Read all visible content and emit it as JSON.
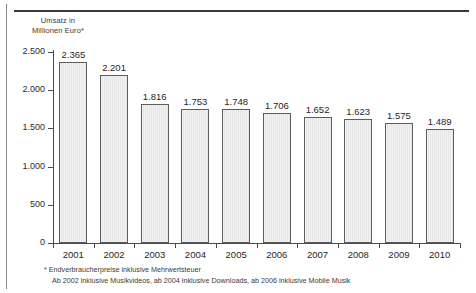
{
  "chart_data": {
    "type": "bar",
    "title": "",
    "subtitle": "",
    "xlabel": "",
    "ylabel": "Umsatz in\nMillionen Euro*",
    "ylim": [
      0,
      2500
    ],
    "ytick_labels": [
      "2.500",
      "2.000",
      "1.500",
      "1.000",
      "500",
      "0"
    ],
    "ytick_values": [
      2500,
      2000,
      1500,
      1000,
      500,
      0
    ],
    "grid": false,
    "legend": "none",
    "categories": [
      "2001",
      "2002",
      "2003",
      "2004",
      "2005",
      "2006",
      "2007",
      "2008",
      "2009",
      "2010"
    ],
    "values": [
      2365,
      2201,
      1816,
      1753,
      1748,
      1706,
      1652,
      1623,
      1575,
      1489
    ],
    "value_labels": [
      "2.365",
      "2.201",
      "1.816",
      "1.753",
      "1.748",
      "1.706",
      "1.652",
      "1.623",
      "1.575",
      "1.489"
    ],
    "bar_fill_color": "#ededed",
    "bar_border_color": "#5d5d5d",
    "axis_color": "#4a4a4a",
    "background_color": "#ffffff",
    "annotations": [
      "* Endverbraucherpreise inklusive Mehrwertsteuer",
      "Ab 2002 inklusive Musikvideos, ab 2004 inklusive Downloads, ab 2006 inklusive Mobile Musik"
    ]
  },
  "footnotes": {
    "line1": "* Endverbraucherpreise inklusive Mehrwertsteuer",
    "line2": "Ab 2002 inklusive Musikvideos, ab 2004 inklusive Downloads, ab 2006 inklusive Mobile Musik"
  },
  "axis": {
    "y_title": "Umsatz in\nMillionen Euro*"
  }
}
